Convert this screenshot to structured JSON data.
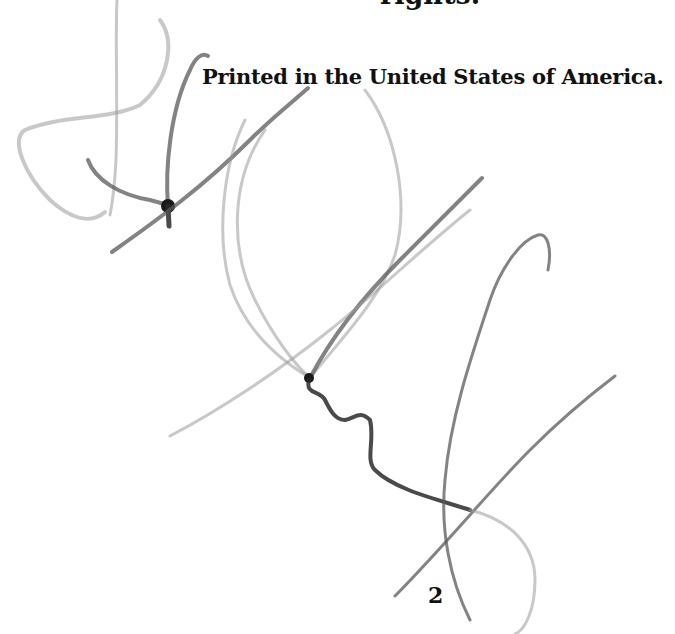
{
  "document": {
    "clipped_top_text": "rights.",
    "printed_notice": "Printed in the United States of America.",
    "page_number": "2"
  },
  "overlay": {
    "type": "pencil-scribble-signature",
    "ink_color": "#2a2a2a"
  }
}
